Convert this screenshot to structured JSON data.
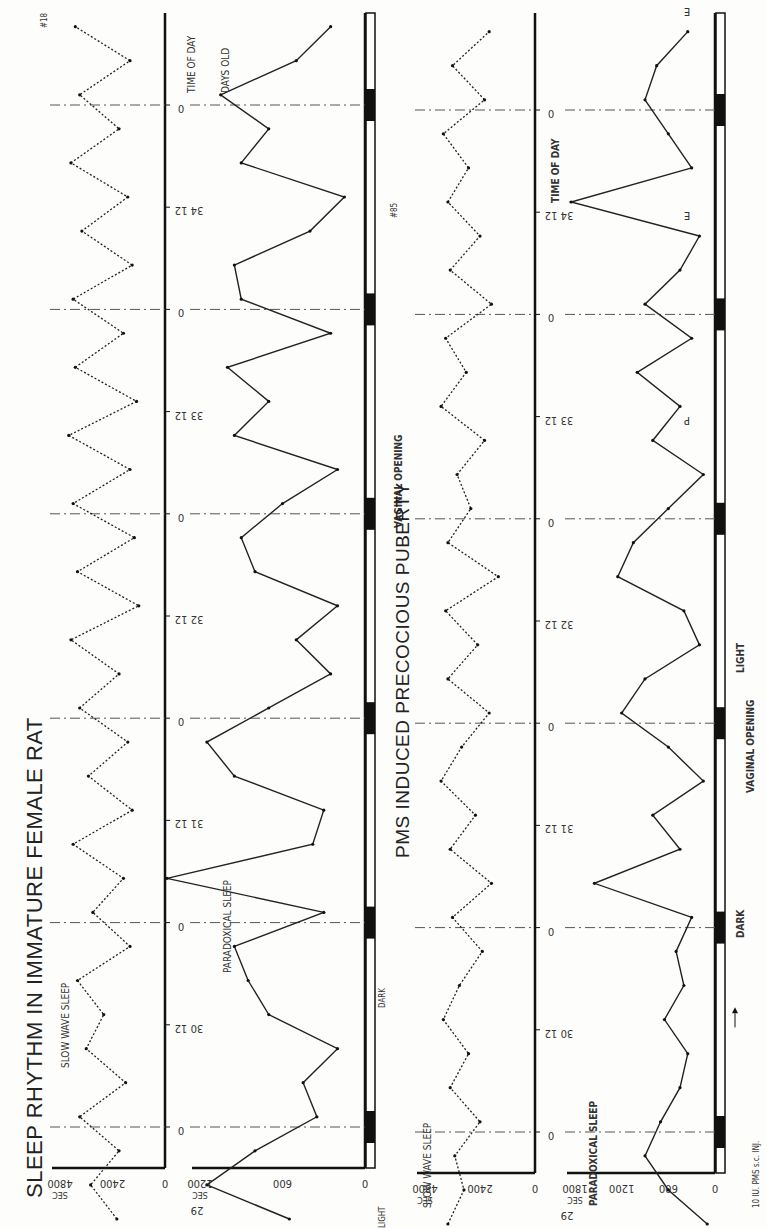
{
  "figure": {
    "title": "SLEEP RHYTHM IN IMMATURE FEMALE RAT",
    "subtitle": "PMS INDUCED PRECOCIOUS PUBERTY",
    "rat_a_id": "#18",
    "rat_b_id": "#85",
    "time_of_day_label": "TIME OF DAY",
    "days_old_label": "DAYS OLD",
    "sec_label": "SEC",
    "light_label": "LIGHT",
    "dark_label": "DARK",
    "vaginal_opening_label": "VAGINAL OPENING",
    "injection_label": "10 IU. PMS s.c. INJ.",
    "sws_label": "SLOW WAVE SLEEP",
    "ps_label": "PARADOXICAL SLEEP",
    "orientation": "rotated 90° counter-clockwise"
  },
  "chart_data": [
    {
      "id": "rat18-sws",
      "type": "line",
      "title": "SLEEP RHYTHM IN IMMATURE FEMALE RAT — #18",
      "series_label": "SLOW WAVE SLEEP",
      "line_style": "dotted",
      "xlabel": "TIME OF DAY (alternating 0 / 12 h)",
      "ylabel": "SEC",
      "ylim": [
        0,
        4800
      ],
      "yticks": [
        0,
        2400,
        4800
      ],
      "days": [
        29,
        30,
        31,
        32,
        33,
        34,
        35,
        36,
        37,
        38,
        39,
        40,
        41,
        42,
        43,
        44,
        45
      ],
      "x_ticks": [
        "0",
        "12",
        "0",
        "12",
        "0",
        "12",
        "0",
        "12",
        "0",
        "12",
        "0",
        "12",
        "0",
        "12",
        "0",
        "12",
        "0",
        "12",
        "0",
        "12",
        "0",
        "12",
        "0",
        "12",
        "0",
        "12",
        "0",
        "12",
        "0",
        "12",
        "0",
        "12",
        "0",
        "12",
        "0"
      ],
      "values": [
        2200,
        3400,
        2100,
        3900,
        1800,
        3600,
        2800,
        4000,
        1600,
        3300,
        1900,
        4200,
        1500,
        3500,
        1700,
        3900,
        2100,
        4300,
        1200,
        4000,
        1400,
        4200,
        1600,
        4400,
        1300,
        4100,
        1900,
        4200,
        1500,
        3800,
        1700,
        4300,
        2100,
        3900,
        1600,
        4100,
        2700,
        4500,
        3100,
        4400,
        1800,
        4300,
        1500,
        4600,
        3000,
        4200,
        1600,
        3800,
        1300,
        3900,
        2000,
        4200,
        1400,
        3700,
        1000,
        4100,
        1800,
        4300,
        1200,
        4200,
        2500,
        4600,
        1500,
        3700,
        900,
        4000,
        2200,
        4500,
        2900,
        3500,
        1800,
        4300
      ]
    },
    {
      "id": "rat18-ps",
      "type": "line",
      "series_label": "PARADOXICAL SLEEP",
      "line_style": "solid",
      "ylabel": "SEC",
      "ylim": [
        0,
        1200
      ],
      "yticks": [
        0,
        600,
        1200
      ],
      "days": [
        29,
        30,
        31,
        32,
        33,
        34,
        35,
        36,
        37,
        38,
        39,
        40,
        41,
        42,
        43,
        44,
        45
      ],
      "annotations": [
        {
          "label": "D",
          "day": 38
        },
        {
          "label": "D",
          "day": 39
        },
        {
          "label": "D",
          "day": 40
        },
        {
          "label": "P",
          "day": 41
        },
        {
          "label": "E",
          "day": 42
        },
        {
          "label": "D",
          "day": 43
        },
        {
          "label": "D",
          "day": 44
        },
        {
          "label": "D",
          "day": 45
        }
      ],
      "vaginal_opening_day": 38,
      "values": [
        550,
        1150,
        800,
        350,
        450,
        200,
        700,
        850,
        950,
        300,
        1440,
        380,
        300,
        950,
        1150,
        700,
        250,
        500,
        200,
        800,
        900,
        600,
        200,
        950,
        700,
        1000,
        250,
        900,
        950,
        400,
        150,
        900,
        700,
        1050,
        500,
        250,
        950,
        1000,
        600,
        300,
        900,
        800,
        1100,
        350,
        700,
        250,
        1000,
        950,
        400,
        200,
        900,
        1000,
        500,
        100,
        750,
        550,
        800,
        900,
        250,
        950,
        400,
        800,
        950,
        250,
        1000,
        650,
        800,
        200,
        1100,
        500,
        150,
        950,
        500,
        700
      ]
    },
    {
      "id": "rat85-sws",
      "type": "line",
      "title": "PMS INDUCED PRECOCIOUS PUBERTY — #85",
      "series_label": "SLOW WAVE SLEEP",
      "line_style": "dotted",
      "ylabel": "SEC",
      "ylim": [
        0,
        4800
      ],
      "yticks": [
        0,
        2400,
        4800
      ],
      "days": [
        29,
        30,
        31,
        32,
        33,
        34,
        35,
        36,
        37,
        38,
        39,
        40,
        41,
        42
      ],
      "values": [
        3800,
        3100,
        3500,
        2400,
        3700,
        2900,
        4000,
        3300,
        2300,
        3600,
        1900,
        3700,
        2600,
        4100,
        3200,
        2000,
        3800,
        2500,
        3900,
        1600,
        3800,
        2800,
        3400,
        2200,
        4100,
        3000,
        3900,
        1900,
        3700,
        2400,
        3800,
        2900,
        4000,
        2200,
        3600,
        2000,
        4200,
        3300,
        1800,
        3900,
        2700,
        3500,
        2100,
        4000,
        3000,
        3600,
        1800,
        4300,
        2800,
        3900,
        2200,
        3700,
        1600,
        4100,
        2900,
        3500,
        2200,
        3900,
        1500,
        4200,
        3200,
        3700,
        1900,
        3400,
        2600,
        4400,
        3100,
        3600,
        1400,
        4300,
        3300,
        2800
      ]
    },
    {
      "id": "rat85-ps",
      "type": "line",
      "series_label": "PARADOXICAL SLEEP",
      "line_style": "solid",
      "ylabel": "SEC",
      "ylim": [
        0,
        1800
      ],
      "yticks": [
        0,
        600,
        1200,
        1800
      ],
      "days": [
        29,
        30,
        31,
        32,
        33,
        34,
        35,
        36,
        37,
        38,
        39,
        40,
        41,
        42
      ],
      "annotations": [
        {
          "label": "P",
          "day": 33
        },
        {
          "label": "E",
          "day": 34
        },
        {
          "label": "E",
          "day": 35
        },
        {
          "label": "D",
          "day": 36
        },
        {
          "label": "D",
          "day": 37
        },
        {
          "label": "D",
          "day": 38
        },
        {
          "label": "D",
          "day": 39
        },
        {
          "label": "D",
          "day": 40
        },
        {
          "label": "D",
          "day": 41
        },
        {
          "label": "D",
          "day": 42
        }
      ],
      "injection_day": 30,
      "vaginal_opening_day": 33,
      "values": [
        100,
        600,
        900,
        700,
        450,
        350,
        650,
        400,
        500,
        300,
        1550,
        450,
        800,
        150,
        600,
        1200,
        900,
        200,
        400,
        1250,
        1050,
        600,
        150,
        800,
        450,
        1000,
        300,
        900,
        450,
        200,
        1850,
        300,
        600,
        900,
        750,
        350,
        1250,
        1600,
        400,
        900,
        1100,
        300,
        1900,
        200,
        600,
        1000,
        400,
        1300,
        800,
        250,
        700,
        350,
        600,
        200,
        1150,
        700,
        450,
        1000,
        250,
        800,
        150,
        1250,
        650,
        400,
        1100,
        800,
        300,
        1050,
        300,
        1150,
        800,
        400
      ]
    }
  ]
}
